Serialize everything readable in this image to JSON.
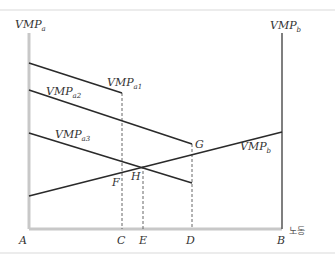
{
  "diagram": {
    "type": "economics-two-sector-labor-allocation",
    "axes": {
      "left_label": "VMP",
      "left_sub": "a",
      "right_label": "VMP",
      "right_sub": "b",
      "origin_left": "A",
      "origin_right": "B",
      "x_unit_label": "노동"
    },
    "curves": [
      {
        "id": "vmp_a1",
        "label": "VMP",
        "sub": "a1"
      },
      {
        "id": "vmp_a2",
        "label": "VMP",
        "sub": "a2"
      },
      {
        "id": "vmp_a3",
        "label": "VMP",
        "sub": "a3"
      },
      {
        "id": "vmp_b",
        "label": "VMP",
        "sub": "b"
      }
    ],
    "points": {
      "F": "F",
      "G": "G",
      "H": "H"
    },
    "x_ticks": [
      "A",
      "C",
      "E",
      "D",
      "B"
    ],
    "colors": {
      "axis": "#c8c8c8",
      "right_axis": "#555555",
      "curve": "#2a2a2a",
      "dashed": "#666666"
    }
  }
}
